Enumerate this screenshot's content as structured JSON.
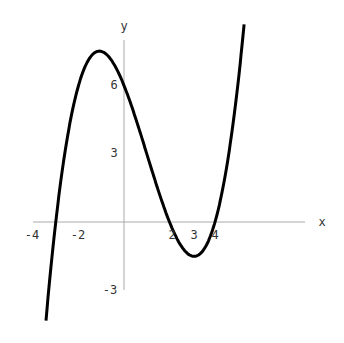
{
  "chart_data": {
    "type": "line",
    "title": "",
    "xlabel": "x",
    "ylabel": "y",
    "function": "f(x) = (x+3)(x-2)(x-4)/4",
    "x_ticks": [
      -4,
      -2,
      2,
      3,
      4
    ],
    "y_ticks": [
      6,
      3,
      -3
    ],
    "xlim": [
      -4,
      8
    ],
    "ylim": [
      -4.5,
      8
    ],
    "grid": false,
    "series": [
      {
        "name": "f(x)",
        "color": "#000000",
        "x": [
          -3.4,
          -3,
          -2.5,
          -2,
          -1.5,
          -1.2,
          -1,
          -0.5,
          0,
          0.5,
          1,
          1.5,
          2,
          2.5,
          3,
          3.5,
          4,
          4.5,
          5,
          5.3
        ],
        "y": [
          -3.84,
          0,
          2.53,
          4.5,
          5.63,
          5.76,
          5.6,
          5.18,
          6.0,
          3.91,
          3.0,
          1.8,
          0,
          -0.98,
          -1.5,
          -1.52,
          0,
          1.69,
          4.5,
          6.45
        ]
      }
    ]
  },
  "labels": {
    "x_axis": "x",
    "y_axis": "y",
    "x_tick_labels": [
      "-4",
      "-2",
      "2",
      "3",
      "4"
    ],
    "y_tick_labels": [
      "6",
      "3",
      "-3"
    ]
  }
}
